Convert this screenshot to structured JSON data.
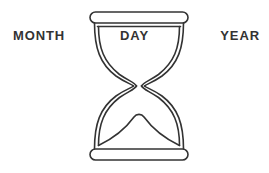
{
  "canvas": {
    "width": 269,
    "height": 173,
    "background_color": "#ffffff"
  },
  "graphic": {
    "name": "hourglass",
    "stroke_color": "#333333",
    "fill_color": "none",
    "stroke_width": 1.6,
    "description": "Line-art hourglass with double-walled glass, rounded top cap, pinched waist, sand mound in lower chamber and rounded base bar"
  },
  "labels": {
    "left": "MONTH",
    "center": "DAY",
    "right": "YEAR",
    "text_color": "#333333"
  }
}
